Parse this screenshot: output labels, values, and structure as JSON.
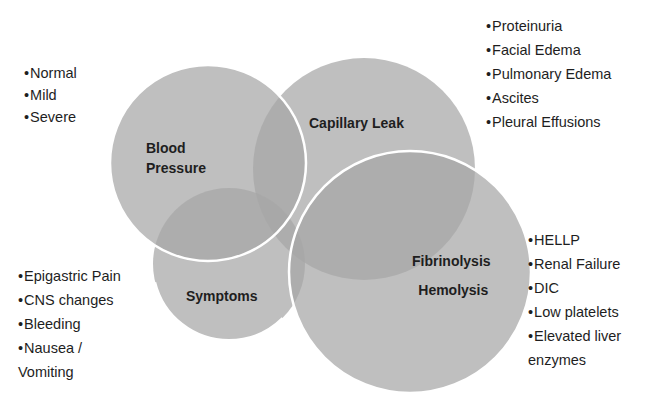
{
  "diagram": {
    "circles": [
      {
        "id": "blood-pressure",
        "label_lines": [
          "Blood",
          "Pressure"
        ],
        "cx": 208,
        "cy": 163,
        "r": 98
      },
      {
        "id": "capillary-leak",
        "label_lines": [
          "Capillary Leak"
        ],
        "cx": 364,
        "cy": 169,
        "r": 110
      },
      {
        "id": "symptoms",
        "label_lines": [
          "Symptoms"
        ],
        "cx": 229,
        "cy": 264,
        "r": 76
      },
      {
        "id": "fibrinolysis-hemolysis",
        "label_lines": [
          "Fibrinolysis",
          "Hemolysis"
        ],
        "cx": 410,
        "cy": 272,
        "r": 120
      }
    ],
    "fill_color": "#a8a8a8",
    "stroke_color": "#ffffff"
  },
  "lists": {
    "blood_pressure": [
      "Normal",
      "Mild",
      "Severe"
    ],
    "capillary_leak": [
      "Proteinuria",
      "Facial Edema",
      "Pulmonary Edema",
      "Ascites",
      "Pleural Effusions"
    ],
    "symptoms": [
      "Epigastric Pain",
      "CNS changes",
      "Bleeding",
      "Nausea /",
      "Vomiting"
    ],
    "fibrinolysis_hemolysis": [
      "HELLP",
      "Renal Failure",
      "DIC",
      "Low platelets",
      "Elevated liver",
      "enzymes"
    ]
  },
  "bullet": "•"
}
